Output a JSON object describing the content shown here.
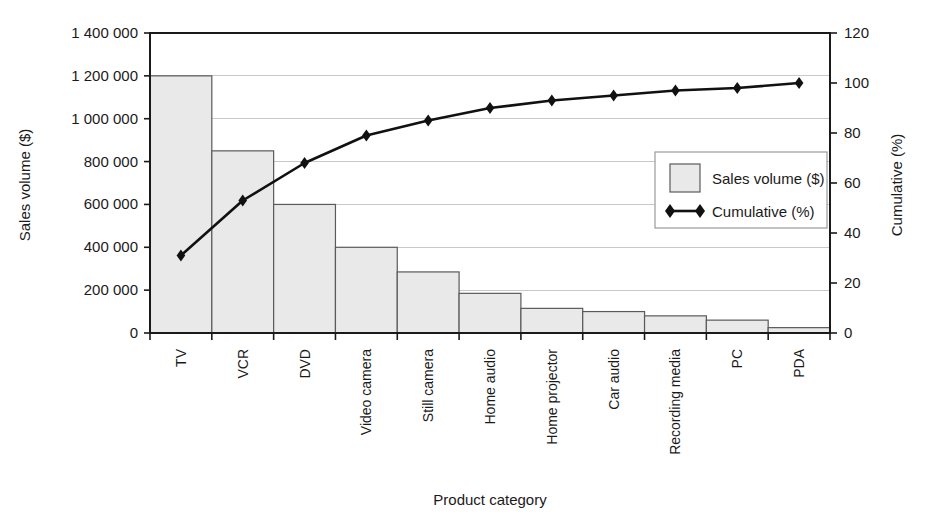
{
  "chart_data": {
    "type": "bar",
    "title": "",
    "subtitle": "",
    "xlabel": "Product category",
    "ylabel": "Sales volume ($)",
    "y2label": "Cumulative (%)",
    "grid": true,
    "legend_position": "center-right",
    "categories": [
      "TV",
      "VCR",
      "DVD",
      "Video camera",
      "Still camera",
      "Home audio",
      "Home projector",
      "Car audio",
      "Recording media",
      "PC",
      "PDA"
    ],
    "series": [
      {
        "name": "Sales volume ($)",
        "type": "bar",
        "axis": "left",
        "values": [
          1200000,
          850000,
          600000,
          400000,
          285000,
          185000,
          115000,
          100000,
          80000,
          60000,
          25000
        ]
      },
      {
        "name": "Cumulative (%)",
        "type": "line",
        "axis": "right",
        "values": [
          31,
          53,
          68,
          79,
          85,
          90,
          93,
          95,
          97,
          98,
          100
        ]
      }
    ],
    "ylim": [
      0,
      1400000
    ],
    "yticks": [
      0,
      200000,
      400000,
      600000,
      800000,
      1000000,
      1200000,
      1400000
    ],
    "ytick_labels": [
      "0",
      "200 000",
      "400 000",
      "600 000",
      "800 000",
      "1 000 000",
      "1 200 000",
      "1 400 000"
    ],
    "y2lim": [
      0,
      120
    ],
    "y2ticks": [
      0,
      20,
      40,
      60,
      80,
      100,
      120
    ],
    "y2tick_labels": [
      "0",
      "20",
      "40",
      "60",
      "80",
      "100",
      "120"
    ],
    "colors": {
      "bar_fill": "#e9e9e9",
      "bar_stroke": "#5a5a5a",
      "line": "#111111",
      "grid": "#c8c8c8",
      "axis": "#1a1a1a",
      "background": "#ffffff"
    }
  },
  "legend": {
    "entries": [
      {
        "label": "Sales volume ($)",
        "marker": "square-swatch"
      },
      {
        "label": "Cumulative (%)",
        "marker": "diamond-line"
      }
    ]
  },
  "axes": {
    "left_title": "Sales volume ($)",
    "right_title": "Cumulative (%)",
    "bottom_title": "Product category"
  }
}
